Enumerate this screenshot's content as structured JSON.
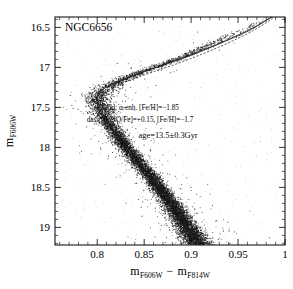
{
  "figure": {
    "width": 293,
    "height": 289,
    "background": "#ffffff",
    "ink_color": "#000000"
  },
  "chart_data": {
    "type": "scatter",
    "title": "",
    "cluster_label": "NGC6656",
    "xlabel": "m_F606W - m_F814W",
    "ylabel": "m_F606W",
    "xlabel_parts": {
      "m1_base": "m",
      "m1_sub": "F606W",
      "operator": "−",
      "m2_base": "m",
      "m2_sub": "F814W"
    },
    "ylabel_parts": {
      "base": "m",
      "sub": "F606W"
    },
    "xlim": [
      0.755,
      1.0
    ],
    "ylim": [
      16.37,
      19.22
    ],
    "y_inverted": true,
    "xticks": [
      0.8,
      0.85,
      0.9,
      0.95,
      1
    ],
    "xticklabels": [
      "0.8",
      "0.85",
      "0.9",
      "0.95",
      "1"
    ],
    "yticks": [
      16.5,
      17,
      17.5,
      18,
      18.5,
      19
    ],
    "yticklabels": [
      "16.5",
      "17",
      "17.5",
      "18",
      "18.5",
      "19"
    ],
    "x_minor_per_interval": 5,
    "y_minor_per_interval": 5,
    "grid": false,
    "legend_position": "none",
    "point_count": 9000,
    "point_color": "#151515",
    "point_size_px": 0.55,
    "annotations": [
      {
        "name": "solid-isochrone-note",
        "text": "solid: α-enh. [Fe/H]=−1.85",
        "x": 0.8455,
        "y": 17.53
      },
      {
        "name": "dash-isochrone-note",
        "text": "dash: [CNO/Fe]=+0.15, [Fe/H]=−1.7",
        "x": 0.8455,
        "y": 17.685
      },
      {
        "name": "age-note",
        "text": "age=13.5±0.3Gyr",
        "x": 0.8755,
        "y": 17.885
      }
    ],
    "series": [
      {
        "name": "observed-stars",
        "kind": "scatter",
        "description": "HST photometry of globular cluster NGC6656 (M22): main sequence, turnoff, subgiant branch and red giant branch",
        "ridge": [
          {
            "y": 19.2,
            "x": 0.9075,
            "w": 0.0135
          },
          {
            "y": 19.05,
            "x": 0.8985,
            "w": 0.013
          },
          {
            "y": 18.9,
            "x": 0.89,
            "w": 0.0126
          },
          {
            "y": 18.75,
            "x": 0.8815,
            "w": 0.0122
          },
          {
            "y": 18.6,
            "x": 0.872,
            "w": 0.012
          },
          {
            "y": 18.45,
            "x": 0.8625,
            "w": 0.0118
          },
          {
            "y": 18.3,
            "x": 0.852,
            "w": 0.0116
          },
          {
            "y": 18.15,
            "x": 0.8415,
            "w": 0.0115
          },
          {
            "y": 18.0,
            "x": 0.831,
            "w": 0.0115
          },
          {
            "y": 17.85,
            "x": 0.8215,
            "w": 0.0115
          },
          {
            "y": 17.7,
            "x": 0.8125,
            "w": 0.0118
          },
          {
            "y": 17.55,
            "x": 0.8055,
            "w": 0.0122
          },
          {
            "y": 17.45,
            "x": 0.8018,
            "w": 0.0126
          },
          {
            "y": 17.38,
            "x": 0.8008,
            "w": 0.013
          },
          {
            "y": 17.32,
            "x": 0.803,
            "w": 0.0132
          },
          {
            "y": 17.26,
            "x": 0.809,
            "w": 0.013
          },
          {
            "y": 17.2,
            "x": 0.818,
            "w": 0.0125
          },
          {
            "y": 17.12,
            "x": 0.833,
            "w": 0.0118
          },
          {
            "y": 17.04,
            "x": 0.851,
            "w": 0.011
          },
          {
            "y": 16.96,
            "x": 0.87,
            "w": 0.0104
          },
          {
            "y": 16.88,
            "x": 0.888,
            "w": 0.0098
          },
          {
            "y": 16.8,
            "x": 0.904,
            "w": 0.0094
          },
          {
            "y": 16.72,
            "x": 0.919,
            "w": 0.0092
          },
          {
            "y": 16.64,
            "x": 0.934,
            "w": 0.0092
          },
          {
            "y": 16.56,
            "x": 0.95,
            "w": 0.0094
          },
          {
            "y": 16.48,
            "x": 0.965,
            "w": 0.0096
          },
          {
            "y": 16.42,
            "x": 0.976,
            "w": 0.0098
          },
          {
            "y": 16.38,
            "x": 0.983,
            "w": 0.01
          }
        ]
      },
      {
        "name": "isochrone-solid-alpha-enhanced",
        "kind": "line",
        "style": "solid",
        "label": "solid: α-enh. [Fe/H]=−1.85",
        "points": [
          [
            0.909,
            19.21
          ],
          [
            0.899,
            19.05
          ],
          [
            0.889,
            18.88
          ],
          [
            0.878,
            18.7
          ],
          [
            0.866,
            18.5
          ],
          [
            0.854,
            18.31
          ],
          [
            0.842,
            18.13
          ],
          [
            0.83,
            17.97
          ],
          [
            0.82,
            17.83
          ],
          [
            0.811,
            17.69
          ],
          [
            0.8045,
            17.56
          ],
          [
            0.801,
            17.45
          ],
          [
            0.8,
            17.37
          ],
          [
            0.8025,
            17.31
          ],
          [
            0.8085,
            17.255
          ],
          [
            0.818,
            17.205
          ],
          [
            0.832,
            17.135
          ],
          [
            0.85,
            17.055
          ],
          [
            0.87,
            16.975
          ],
          [
            0.889,
            16.895
          ],
          [
            0.906,
            16.82
          ],
          [
            0.922,
            16.745
          ],
          [
            0.938,
            16.665
          ],
          [
            0.954,
            16.585
          ],
          [
            0.968,
            16.5
          ],
          [
            0.979,
            16.42
          ],
          [
            0.9855,
            16.372
          ]
        ]
      },
      {
        "name": "isochrone-dashed-cno-enhanced",
        "kind": "line",
        "style": "dashed",
        "label": "dash: [CNO/Fe]=+0.15, [Fe/H]=−1.7",
        "points": [
          [
            0.9135,
            19.21
          ],
          [
            0.9035,
            19.05
          ],
          [
            0.8935,
            18.88
          ],
          [
            0.8825,
            18.7
          ],
          [
            0.8705,
            18.5
          ],
          [
            0.8585,
            18.31
          ],
          [
            0.8465,
            18.13
          ],
          [
            0.8345,
            17.97
          ],
          [
            0.8245,
            17.83
          ],
          [
            0.8155,
            17.69
          ],
          [
            0.809,
            17.56
          ],
          [
            0.8055,
            17.45
          ],
          [
            0.8048,
            17.37
          ],
          [
            0.808,
            17.305
          ],
          [
            0.8155,
            17.25
          ],
          [
            0.827,
            17.195
          ],
          [
            0.843,
            17.125
          ],
          [
            0.861,
            17.05
          ],
          [
            0.88,
            16.975
          ],
          [
            0.8975,
            16.9
          ],
          [
            0.9135,
            16.825
          ],
          [
            0.929,
            16.75
          ],
          [
            0.944,
            16.67
          ],
          [
            0.959,
            16.585
          ],
          [
            0.972,
            16.5
          ],
          [
            0.982,
            16.425
          ],
          [
            0.988,
            16.375
          ]
        ]
      },
      {
        "name": "isochrone-solid-secondary",
        "kind": "line",
        "style": "solid",
        "points": [
          [
            0.9065,
            19.21
          ],
          [
            0.8965,
            19.05
          ],
          [
            0.8862,
            18.88
          ],
          [
            0.8752,
            18.7
          ],
          [
            0.8632,
            18.5
          ],
          [
            0.8512,
            18.31
          ],
          [
            0.8392,
            18.13
          ],
          [
            0.8275,
            17.97
          ],
          [
            0.8178,
            17.83
          ],
          [
            0.809,
            17.69
          ],
          [
            0.8028,
            17.56
          ],
          [
            0.7998,
            17.44
          ],
          [
            0.7995,
            17.355
          ],
          [
            0.803,
            17.295
          ],
          [
            0.81,
            17.24
          ],
          [
            0.8205,
            17.185
          ],
          [
            0.8355,
            17.115
          ],
          [
            0.8535,
            17.035
          ],
          [
            0.8735,
            16.955
          ],
          [
            0.892,
            16.878
          ],
          [
            0.909,
            16.8
          ],
          [
            0.925,
            16.725
          ],
          [
            0.9405,
            16.645
          ],
          [
            0.956,
            16.565
          ],
          [
            0.97,
            16.48
          ],
          [
            0.9805,
            16.405
          ],
          [
            0.986,
            16.372
          ]
        ]
      }
    ]
  }
}
